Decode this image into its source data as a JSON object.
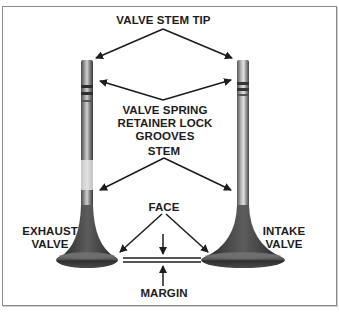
{
  "diagram": {
    "labels": {
      "valve_stem_tip": "VALVE STEM TIP",
      "retainer_grooves_line1": "VALVE SPRING",
      "retainer_grooves_line2": "RETAINER LOCK",
      "retainer_grooves_line3": "GROOVES",
      "stem": "STEM",
      "face": "FACE",
      "margin": "MARGIN",
      "exhaust_line1": "EXHAUST",
      "exhaust_line2": "VALVE",
      "intake_line1": "INTAKE",
      "intake_line2": "VALVE"
    },
    "components": [
      "exhaust valve",
      "intake valve"
    ],
    "colors": {
      "frame": "#8a8a8a",
      "text": "#1c1c1c",
      "arrow": "#1c1c1c",
      "valve_dark": "#3a3a3a",
      "valve_light": "#d8d8d8"
    }
  }
}
